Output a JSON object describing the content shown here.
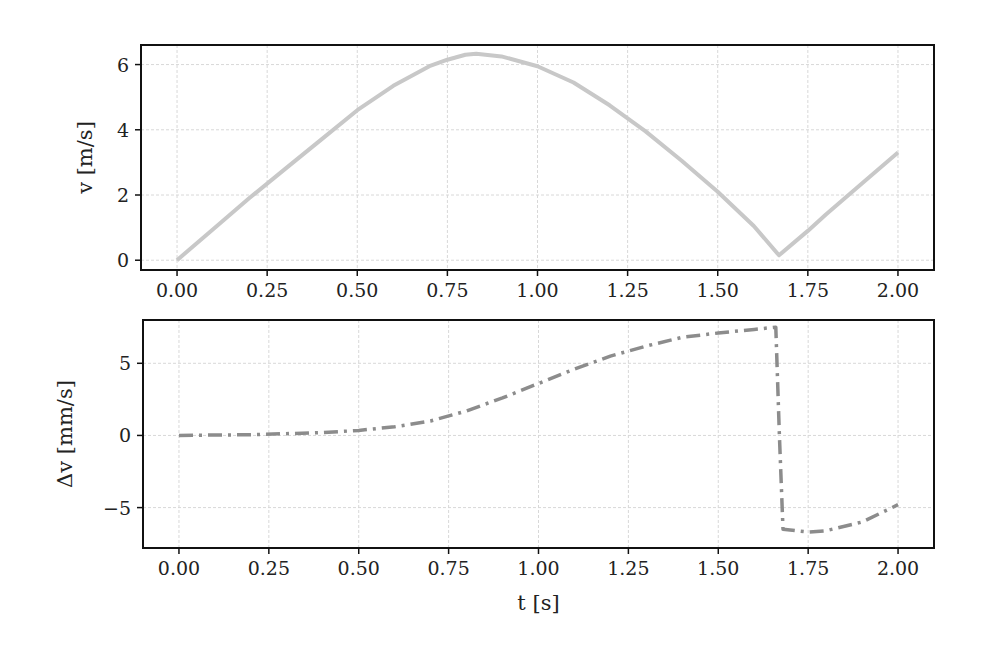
{
  "chart_data": [
    {
      "type": "line",
      "title": "",
      "xlabel": "",
      "ylabel": "v [m/s]",
      "xlim": [
        -0.1,
        2.1
      ],
      "ylim": [
        -0.3,
        6.6
      ],
      "grid": true,
      "xticks": [
        "0.00",
        "0.25",
        "0.50",
        "0.75",
        "1.00",
        "1.25",
        "1.50",
        "1.75",
        "2.00"
      ],
      "yticks": [
        "0",
        "2",
        "4",
        "6"
      ],
      "series": [
        {
          "name": "v",
          "style": "solid",
          "color": "#c8c8c8",
          "x": [
            0.0,
            0.1,
            0.2,
            0.3,
            0.4,
            0.5,
            0.6,
            0.7,
            0.75,
            0.8,
            0.83,
            0.9,
            1.0,
            1.1,
            1.2,
            1.3,
            1.4,
            1.5,
            1.6,
            1.67,
            1.75,
            1.8,
            1.9,
            2.0
          ],
          "values": [
            0.0,
            0.95,
            1.9,
            2.8,
            3.7,
            4.6,
            5.35,
            5.95,
            6.15,
            6.3,
            6.33,
            6.25,
            5.95,
            5.45,
            4.75,
            3.95,
            3.05,
            2.1,
            1.05,
            0.15,
            0.9,
            1.4,
            2.35,
            3.3
          ]
        }
      ]
    },
    {
      "type": "line",
      "title": "",
      "xlabel": "t [s]",
      "ylabel": "Δv [mm/s]",
      "xlim": [
        -0.1,
        2.1
      ],
      "ylim": [
        -7.8,
        8.0
      ],
      "grid": true,
      "xticks": [
        "0.00",
        "0.25",
        "0.50",
        "0.75",
        "1.00",
        "1.25",
        "1.50",
        "1.75",
        "2.00"
      ],
      "yticks": [
        "−5",
        "0",
        "5"
      ],
      "series": [
        {
          "name": "Δv",
          "style": "dashdot",
          "color": "#8c8c8c",
          "x": [
            0.0,
            0.2,
            0.4,
            0.5,
            0.6,
            0.7,
            0.8,
            0.9,
            1.0,
            1.1,
            1.2,
            1.3,
            1.4,
            1.5,
            1.6,
            1.66,
            1.67,
            1.68,
            1.75,
            1.8,
            1.9,
            2.0
          ],
          "values": [
            0.0,
            0.05,
            0.2,
            0.35,
            0.6,
            1.0,
            1.7,
            2.6,
            3.6,
            4.6,
            5.5,
            6.2,
            6.8,
            7.1,
            7.35,
            7.5,
            0.0,
            -6.5,
            -6.7,
            -6.6,
            -6.0,
            -4.8
          ]
        }
      ]
    }
  ]
}
